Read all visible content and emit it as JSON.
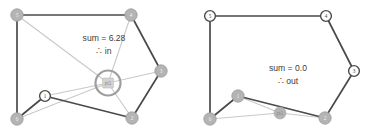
{
  "figure": {
    "caption_left": "sum = 6.28",
    "caption_left_2": "∴ in",
    "caption_right": "sum = 0.0",
    "caption_right_2": "∴ out",
    "colors": {
      "edge": "#4a4a4a",
      "ray": "#c9c9c9",
      "node_fill": "#b4b4b4",
      "node_open_fill": "#ffffff",
      "ring": "#9e9e9e",
      "text": "#3c3c3c",
      "background": "#ffffff"
    }
  },
  "chart_data": {
    "type": "diagram",
    "panels": [
      {
        "id": "left",
        "result_label": "sum = 6.28",
        "result_conclusion": "∴ in",
        "winding_sum": 6.28,
        "classification": "in",
        "test_point": {
          "name": "pt1",
          "x": 108,
          "y": 83,
          "marker": "square",
          "ring": true
        },
        "polygon_order": [
          "0",
          "1",
          "2",
          "3",
          "4",
          "5"
        ],
        "vertices": [
          {
            "label": "0",
            "x": 17,
            "y": 119,
            "style": "filled"
          },
          {
            "label": "1",
            "x": 45,
            "y": 96,
            "style": "open"
          },
          {
            "label": "2",
            "x": 132,
            "y": 118,
            "style": "filled"
          },
          {
            "label": "3",
            "x": 161,
            "y": 71,
            "style": "filled"
          },
          {
            "label": "4",
            "x": 131,
            "y": 15,
            "style": "filled"
          },
          {
            "label": "5",
            "x": 17,
            "y": 15,
            "style": "filled"
          }
        ],
        "edges": [
          [
            "0",
            "1"
          ],
          [
            "1",
            "2"
          ],
          [
            "2",
            "3"
          ],
          [
            "3",
            "4"
          ],
          [
            "4",
            "5"
          ],
          [
            "5",
            "0"
          ]
        ],
        "rays": [
          "0",
          "1",
          "2",
          "3",
          "4",
          "5"
        ],
        "label_pos": {
          "x": 104,
          "y": 41,
          "x2": 104,
          "y2": 54
        }
      },
      {
        "id": "right",
        "result_label": "sum = 0.0",
        "result_conclusion": "∴ out",
        "winding_sum": 0.0,
        "classification": "out",
        "test_point": {
          "name": "pt1",
          "x": 280,
          "y": 113,
          "marker": "circle",
          "ring": false
        },
        "polygon_order": [
          "0",
          "1",
          "2",
          "3",
          "4",
          "5"
        ],
        "vertices": [
          {
            "label": "0",
            "x": 210,
            "y": 119,
            "style": "filled"
          },
          {
            "label": "1",
            "x": 238,
            "y": 96,
            "style": "filled"
          },
          {
            "label": "2",
            "x": 325,
            "y": 118,
            "style": "filled"
          },
          {
            "label": "3",
            "x": 354,
            "y": 71,
            "style": "open"
          },
          {
            "label": "4",
            "x": 326,
            "y": 16,
            "style": "open"
          },
          {
            "label": "5",
            "x": 210,
            "y": 16,
            "style": "open"
          }
        ],
        "edges": [
          [
            "0",
            "1"
          ],
          [
            "1",
            "2"
          ],
          [
            "2",
            "3"
          ],
          [
            "3",
            "4"
          ],
          [
            "4",
            "5"
          ],
          [
            "5",
            "0"
          ]
        ],
        "rays": [
          "0",
          "1",
          "2"
        ],
        "label_pos": {
          "x": 288,
          "y": 71,
          "x2": 288,
          "y2": 84
        }
      }
    ]
  }
}
